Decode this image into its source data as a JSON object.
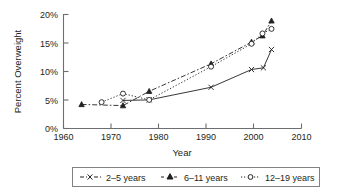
{
  "chart_data": {
    "type": "line",
    "title": "",
    "xlabel": "Year",
    "ylabel": "Percent Overweight",
    "xlim": [
      1960,
      2010
    ],
    "ylim": [
      0,
      20
    ],
    "xticks": [
      1960,
      1970,
      1980,
      1990,
      2000,
      2010
    ],
    "xtick_labels": [
      "1960",
      "1970",
      "1980",
      "1990",
      "2000",
      "2010"
    ],
    "yticks": [
      0,
      5,
      10,
      15,
      20
    ],
    "ytick_labels": [
      "0%",
      "5%",
      "10%",
      "15%",
      "20%"
    ],
    "grid": false,
    "legend_position": "below",
    "series": [
      {
        "name": "2–5 years",
        "marker": "x",
        "line_style": "solid",
        "x": [
          1972.5,
          1978,
          1991,
          1999.5,
          2002,
          2003.7
        ],
        "values": [
          4.9,
          5.0,
          7.2,
          10.3,
          10.6,
          13.8
        ]
      },
      {
        "name": "6–11 years",
        "marker": "triangle",
        "line_style": "dashdot",
        "x": [
          1963.8,
          1972.5,
          1978,
          1991,
          1999.5,
          2001.8,
          2003.7
        ],
        "values": [
          4.2,
          4.0,
          6.5,
          11.3,
          15.1,
          16.2,
          18.8
        ]
      },
      {
        "name": "12–19 years",
        "marker": "circle",
        "line_style": "dotted",
        "x": [
          1968,
          1972.5,
          1978,
          1991,
          1999.5,
          2001.8,
          2003.7
        ],
        "values": [
          4.6,
          6.1,
          5.0,
          10.8,
          14.8,
          16.6,
          17.4
        ]
      }
    ]
  },
  "axes": {
    "y_title": "Percent Overweight",
    "x_title": "Year",
    "x_tick_labels": [
      "1960",
      "1970",
      "1980",
      "1990",
      "2000",
      "2010"
    ],
    "y_tick_labels": [
      "0%",
      "5%",
      "10%",
      "15%",
      "20%"
    ]
  },
  "legend": {
    "entries": [
      {
        "label": "2–5 years",
        "marker": "x-marker",
        "style": "dashed"
      },
      {
        "label": "6–11 years",
        "marker": "triangle-marker",
        "style": "dash-dot"
      },
      {
        "label": "12–19 years",
        "marker": "circle-marker",
        "style": "dotted"
      }
    ]
  },
  "colors": {
    "ink": "#231f20",
    "axis": "#6d6e71",
    "legend_border": "#808285",
    "background": "#ffffff"
  }
}
